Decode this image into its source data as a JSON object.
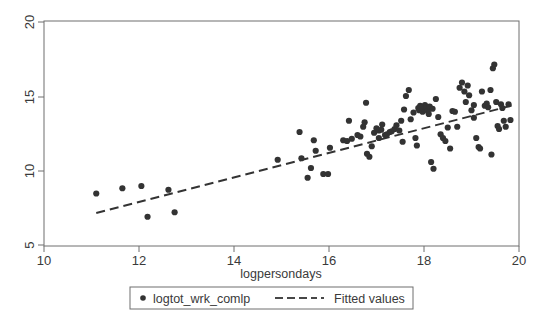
{
  "chart_data": {
    "type": "scatter",
    "title": "",
    "xlabel": "logpersondays",
    "ylabel": "",
    "xlim": [
      10,
      20
    ],
    "ylim": [
      5,
      20
    ],
    "xticks": [
      10,
      12,
      14,
      16,
      18,
      20
    ],
    "yticks": [
      5,
      10,
      15,
      20
    ],
    "xtick_labels": [
      "10",
      "12",
      "14",
      "16",
      "18",
      "20"
    ],
    "ytick_labels": [
      "5",
      "10",
      "15",
      "20"
    ],
    "grid": false,
    "frame": "box",
    "ytick_label_rotation": -90,
    "legend": {
      "position": "below-axes",
      "boxed": true,
      "entries": [
        {
          "label": "logtot_wrk_comlp",
          "marker": "circle",
          "style": "scatter",
          "color": "#333333"
        },
        {
          "label": "Fitted values",
          "marker": "dashed-line",
          "style": "line",
          "color": "#333333"
        }
      ]
    },
    "series": [
      {
        "name": "logtot_wrk_comlp",
        "type": "scatter",
        "marker": "filled-circle",
        "color": "#333333",
        "points": [
          [
            11.1,
            8.5
          ],
          [
            11.65,
            8.85
          ],
          [
            12.05,
            9.0
          ],
          [
            12.18,
            6.95
          ],
          [
            12.62,
            8.75
          ],
          [
            12.75,
            7.25
          ],
          [
            14.92,
            10.75
          ],
          [
            15.38,
            12.6
          ],
          [
            15.42,
            10.85
          ],
          [
            15.55,
            9.55
          ],
          [
            15.62,
            10.2
          ],
          [
            15.68,
            12.05
          ],
          [
            15.72,
            11.35
          ],
          [
            15.88,
            9.8
          ],
          [
            15.98,
            9.8
          ],
          [
            16.02,
            11.55
          ],
          [
            16.3,
            12.05
          ],
          [
            16.38,
            12.0
          ],
          [
            16.42,
            13.35
          ],
          [
            16.6,
            12.4
          ],
          [
            16.66,
            12.3
          ],
          [
            16.72,
            12.95
          ],
          [
            16.75,
            13.25
          ],
          [
            16.78,
            14.55
          ],
          [
            16.8,
            11.15
          ],
          [
            16.85,
            10.95
          ],
          [
            16.9,
            11.65
          ],
          [
            16.95,
            12.55
          ],
          [
            17.0,
            12.85
          ],
          [
            17.05,
            12.7
          ],
          [
            17.1,
            12.75
          ],
          [
            17.12,
            13.1
          ],
          [
            17.18,
            12.4
          ],
          [
            17.22,
            12.45
          ],
          [
            17.28,
            12.6
          ],
          [
            17.32,
            12.65
          ],
          [
            17.38,
            12.8
          ],
          [
            17.42,
            13.05
          ],
          [
            17.48,
            12.7
          ],
          [
            17.52,
            13.35
          ],
          [
            17.55,
            11.95
          ],
          [
            17.58,
            14.1
          ],
          [
            17.62,
            15.0
          ],
          [
            17.68,
            15.4
          ],
          [
            17.72,
            13.45
          ],
          [
            17.78,
            13.9
          ],
          [
            17.82,
            12.2
          ],
          [
            17.85,
            11.7
          ],
          [
            17.88,
            14.2
          ],
          [
            17.9,
            14.05
          ],
          [
            17.92,
            14.35
          ],
          [
            17.95,
            14.1
          ],
          [
            17.97,
            13.95
          ],
          [
            18.0,
            14.15
          ],
          [
            18.02,
            14.4
          ],
          [
            18.05,
            14.25
          ],
          [
            18.08,
            14.0
          ],
          [
            18.1,
            13.8
          ],
          [
            18.12,
            14.3
          ],
          [
            18.15,
            10.6
          ],
          [
            18.2,
            10.15
          ],
          [
            18.25,
            14.8
          ],
          [
            18.3,
            13.6
          ],
          [
            18.35,
            12.45
          ],
          [
            18.4,
            12.2
          ],
          [
            18.45,
            12.0
          ],
          [
            18.5,
            12.9
          ],
          [
            18.55,
            11.5
          ],
          [
            18.6,
            14.0
          ],
          [
            18.65,
            13.95
          ],
          [
            18.7,
            12.95
          ],
          [
            18.75,
            15.55
          ],
          [
            18.8,
            15.9
          ],
          [
            18.85,
            15.3
          ],
          [
            18.88,
            14.6
          ],
          [
            18.92,
            15.7
          ],
          [
            18.95,
            15.05
          ],
          [
            19.0,
            14.05
          ],
          [
            19.05,
            13.55
          ],
          [
            19.1,
            12.2
          ],
          [
            19.15,
            11.6
          ],
          [
            19.18,
            11.5
          ],
          [
            19.22,
            15.3
          ],
          [
            19.28,
            14.35
          ],
          [
            19.32,
            14.5
          ],
          [
            19.35,
            14.25
          ],
          [
            19.4,
            15.4
          ],
          [
            19.42,
            11.1
          ],
          [
            19.45,
            16.85
          ],
          [
            19.48,
            17.1
          ],
          [
            19.52,
            14.6
          ],
          [
            19.55,
            13.0
          ],
          [
            19.58,
            12.8
          ],
          [
            19.62,
            14.45
          ],
          [
            19.65,
            14.2
          ],
          [
            19.68,
            13.35
          ],
          [
            19.72,
            12.95
          ],
          [
            19.78,
            14.45
          ],
          [
            19.82,
            13.4
          ],
          [
            16.48,
            12.15
          ],
          [
            17.05,
            12.2
          ],
          [
            18.18,
            14.15
          ],
          [
            17.93,
            14.25
          ],
          [
            19.05,
            14.4
          ]
        ]
      },
      {
        "name": "Fitted values",
        "type": "line",
        "style": "dashed",
        "color": "#333333",
        "x": [
          11.1,
          19.9
        ],
        "y": [
          7.2,
          14.4
        ]
      }
    ]
  },
  "legend": {
    "scatter_label": "logtot_wrk_comlp",
    "fitted_label": "Fitted values"
  },
  "axes": {
    "xlabel": "logpersondays"
  }
}
